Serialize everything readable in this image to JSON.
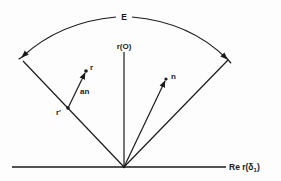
{
  "diagram": {
    "labels": {
      "arc": "E",
      "vertical_axis": "r(O)",
      "horizontal_axis": "Re r(δ",
      "horizontal_axis_sub": "1",
      "horizontal_axis_close": ")",
      "point_r": "r",
      "point_r_prime": "r'",
      "vector_an": "an",
      "vector_n": "n"
    },
    "colors": {
      "ink": "#1a1a1a",
      "background": "#fdfdfd"
    }
  }
}
